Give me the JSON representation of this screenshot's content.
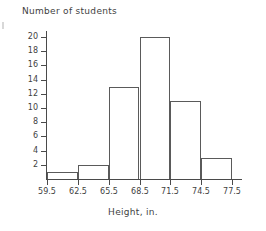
{
  "chart_data": {
    "type": "bar",
    "title": "",
    "xlabel": "Height, in.",
    "ylabel": "Number of students",
    "categories": [
      "59.5-62.5",
      "62.5-65.5",
      "65.5-68.5",
      "68.5-71.5",
      "71.5-74.5",
      "74.5-77.5"
    ],
    "bin_edges": [
      59.5,
      62.5,
      65.5,
      68.5,
      71.5,
      74.5,
      77.5
    ],
    "values": [
      1,
      2,
      13,
      20,
      11,
      3
    ],
    "x_tick_labels": [
      "59.5",
      "62.5",
      "65.5",
      "68.5",
      "71.5",
      "74.5",
      "77.5"
    ],
    "y_tick_labels": [
      "2",
      "4",
      "6",
      "8",
      "10",
      "12",
      "14",
      "16",
      "18",
      "20"
    ],
    "y_tick_values": [
      2,
      4,
      6,
      8,
      10,
      12,
      14,
      16,
      18,
      20
    ],
    "xlim": [
      59.5,
      77.5
    ],
    "ylim": [
      0,
      20.7
    ],
    "grid": false,
    "legend": false,
    "bar_edge_color": "#5a5a5a",
    "bar_fill_color": "none",
    "axis_color": "#4a4a4a",
    "text_color": "#3f3f3f"
  },
  "figure": {
    "y_axis_caption": "Number of students",
    "x_axis_caption": "Height, in."
  }
}
